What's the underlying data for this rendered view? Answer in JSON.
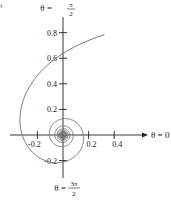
{
  "chart_data": {
    "type": "line",
    "title": "",
    "equation": "r = 1/θ",
    "theta_range": [
      1.18,
      62.8
    ],
    "xlabel": "θ = 0",
    "ylabel_top": "θ = π/2",
    "ylabel_bottom": "θ = 3π/2",
    "x_ticks": [
      -0.2,
      0.2,
      0.4
    ],
    "x_tick_labels": [
      "-0.2",
      "0.2",
      "0.4"
    ],
    "y_ticks": [
      0.8,
      0.6,
      0.4,
      0.2,
      -0.2
    ],
    "y_tick_labels": [
      "0.8",
      "0.6",
      "0.4",
      "0.2",
      "-0.2"
    ],
    "xlim": [
      -0.42,
      0.66
    ],
    "ylim": [
      -0.34,
      0.94
    ],
    "grid": false,
    "legend": null,
    "line_color": "#777777",
    "axis_color": "#222222",
    "sample_points": [
      {
        "theta": "π/2",
        "r": 0.637
      },
      {
        "theta": "π",
        "r": 0.318
      },
      {
        "theta": "3π/2",
        "r": 0.212
      },
      {
        "theta": "2π",
        "r": 0.159
      }
    ]
  },
  "labels": {
    "top_theta": "θ =",
    "top_num": "π",
    "top_den": "2",
    "bottom_theta": "θ =",
    "bottom_num": "3π",
    "bottom_den": "2",
    "right": "θ = 0",
    "corner_mark": ","
  }
}
